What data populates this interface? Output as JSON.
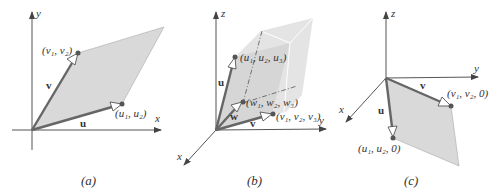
{
  "colors": {
    "fill": "#d9d9d9",
    "fill_light": "#e6e6e6",
    "axis": "#555555",
    "vector": "#666666",
    "point": "#555555",
    "text": "#333333"
  },
  "panel_a": {
    "caption": "(a)",
    "axis_x": "x",
    "axis_y": "y",
    "vector_u": "u",
    "vector_v": "v",
    "point_u": "(u₁, u₂)",
    "point_v": "(v₁, v₂)"
  },
  "panel_b": {
    "caption": "(b)",
    "axis_x": "x",
    "axis_y": "y",
    "axis_z": "z",
    "vector_u": "u",
    "vector_v": "v",
    "vector_w": "w",
    "point_u": "(u₁, u₂, u₃)",
    "point_v": "(v₁, v₂, v₃)",
    "point_w": "(w₁, w₂, w₃)"
  },
  "panel_c": {
    "caption": "(c)",
    "axis_x": "x",
    "axis_y": "y",
    "axis_z": "z",
    "vector_u": "u",
    "vector_v": "v",
    "point_u": "(u₁, u₂, 0)",
    "point_v": "(v₁, v₂, 0)"
  }
}
